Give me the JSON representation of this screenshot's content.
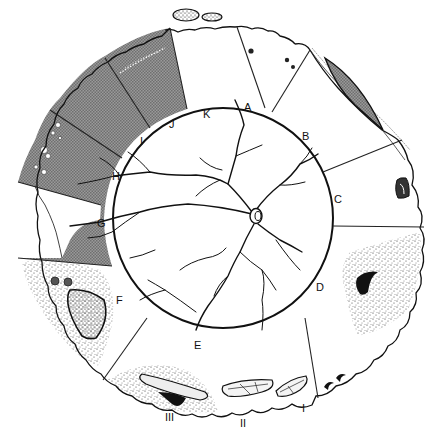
{
  "diagram": {
    "center": {
      "x": 223,
      "y": 218
    },
    "inner_radius": 110,
    "outer_radius": 205,
    "sector_labels": [
      {
        "id": "A",
        "text": "A",
        "x": 244,
        "y": 111
      },
      {
        "id": "B",
        "text": "B",
        "x": 302,
        "y": 140
      },
      {
        "id": "C",
        "text": "C",
        "x": 336,
        "y": 201
      },
      {
        "id": "D",
        "text": "D",
        "x": 316,
        "y": 291
      },
      {
        "id": "E",
        "text": "E",
        "x": 194,
        "y": 349
      },
      {
        "id": "F",
        "text": "F",
        "x": 117,
        "y": 303
      },
      {
        "id": "G",
        "text": "G",
        "x": 99,
        "y": 227
      },
      {
        "id": "H",
        "text": "H",
        "x": 112,
        "y": 180
      },
      {
        "id": "I",
        "text": "I",
        "x": 139,
        "y": 144
      },
      {
        "id": "J",
        "text": "J",
        "x": 169,
        "y": 128
      },
      {
        "id": "K",
        "text": "K",
        "x": 202,
        "y": 117
      }
    ],
    "lesion_labels": [
      {
        "id": "I",
        "text": "I",
        "x": 300,
        "y": 411
      },
      {
        "id": "II",
        "text": "II",
        "x": 240,
        "y": 426
      },
      {
        "id": "III",
        "text": "III",
        "x": 165,
        "y": 421
      }
    ],
    "features": {
      "optic_disc": {
        "x": 256,
        "y": 216
      },
      "shaded_sectors": [
        "G",
        "H",
        "I",
        "J"
      ],
      "shade_color": "#8a8a8a",
      "retinal_tear_upper_right": "sector B",
      "horseshoe_tear_right": "sector C",
      "stippled_lesions": [
        "D",
        "F",
        "lesion III"
      ],
      "lattice_lesions": [
        "I",
        "II",
        "III"
      ],
      "pigment_dots": [
        "A"
      ]
    }
  }
}
